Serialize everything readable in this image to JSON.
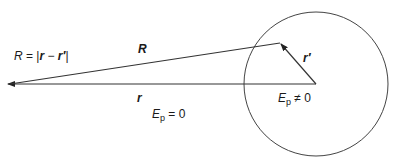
{
  "diagram": {
    "labels": {
      "R_def_lhs": "R",
      "R_def_eq": " = |",
      "R_def_r": "r",
      "R_def_minus": " − ",
      "R_def_rprime": "r′",
      "R_def_close": "|",
      "R_vec": "R",
      "r_vec": "r",
      "rprime_vec": "r′",
      "Ep_outside_E": "E",
      "Ep_outside_sub": "p",
      "Ep_outside_rel": " = 0",
      "Ep_inside_E": "E",
      "Ep_inside_sub": "p",
      "Ep_inside_rel": " ≠ 0"
    },
    "colors": {
      "stroke": "#333333",
      "text": "#1a1a1a"
    }
  }
}
